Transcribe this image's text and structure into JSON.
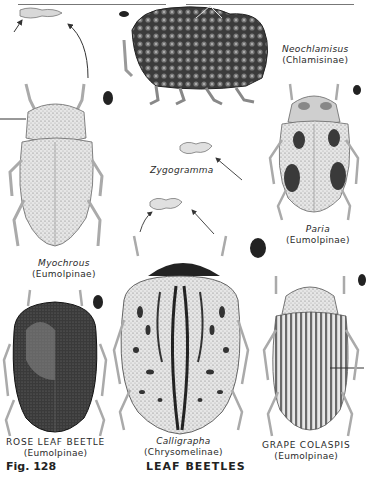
{
  "plate": {
    "figure_label": "Fig. 128",
    "title": "LEAF BEETLES"
  },
  "specimens": [
    {
      "id": "neochlamisus",
      "genus": "Neochlamisus",
      "family": "(Chlamisinae)"
    },
    {
      "id": "myochrous",
      "genus": "Myochrous",
      "family": "(Eumolpinae)"
    },
    {
      "id": "zygogramma",
      "genus": "Zygogramma"
    },
    {
      "id": "paria",
      "genus": "Paria",
      "family": "(Eumolpinae)"
    },
    {
      "id": "rose-leaf-beetle",
      "common": "ROSE LEAF BEETLE",
      "family": "(Eumolpinae)"
    },
    {
      "id": "calligrapha",
      "genus": "Calligrapha",
      "family": "(Chrysomelinae)"
    },
    {
      "id": "grape-colaspis",
      "common": "GRAPE COLASPIS",
      "family": "(Eumolpinae)"
    }
  ]
}
